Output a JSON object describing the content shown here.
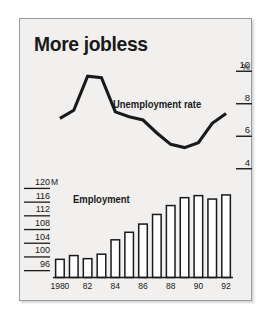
{
  "figure": {
    "title": "More jobless",
    "panel_bg": "#f1f0ee",
    "ink": "#1a1a1a",
    "border_color": "#9a9a9a"
  },
  "labels": {
    "unemployment": "Unemployment rate",
    "employment": "Employment",
    "percent_symbol": "%",
    "millions_unit": "M"
  },
  "axes": {
    "right_ticks": [
      "10",
      "8",
      "6",
      "4"
    ],
    "right_tick_values": [
      10,
      8,
      6,
      4
    ],
    "left_ticks": [
      "120",
      "116",
      "112",
      "108",
      "104",
      "100",
      "96"
    ],
    "left_tick_values": [
      120,
      116,
      112,
      108,
      104,
      100,
      96
    ],
    "x_ticks": [
      "1980",
      "82",
      "84",
      "86",
      "88",
      "90",
      "92"
    ],
    "x_tick_years": [
      1980,
      1982,
      1984,
      1986,
      1988,
      1990,
      1992
    ]
  },
  "chart_data": {
    "type": "bar",
    "title": "More jobless",
    "xlabel": "",
    "ylabel": "",
    "grid": false,
    "legend_position": "inline-annotation",
    "categories": [
      "1980",
      "1981",
      "1982",
      "1983",
      "1984",
      "1985",
      "1986",
      "1987",
      "1988",
      "1989",
      "1990",
      "1991",
      "1992"
    ],
    "x": [
      1980,
      1981,
      1982,
      1983,
      1984,
      1985,
      1986,
      1987,
      1988,
      1989,
      1990,
      1991,
      1992
    ],
    "series": [
      {
        "name": "Employment",
        "type": "bar",
        "unit": "millions",
        "axis": "left",
        "ylim": [
          94,
          121
        ],
        "ylabel": "120 M",
        "values": [
          99.3,
          100.4,
          99.5,
          100.8,
          105.0,
          107.2,
          109.6,
          112.4,
          115.0,
          117.3,
          117.9,
          116.9,
          118.1
        ]
      },
      {
        "name": "Unemployment rate",
        "type": "line",
        "unit": "percent",
        "axis": "right",
        "ylim": [
          3.0,
          11.0
        ],
        "ylabel": "%",
        "values": [
          7.1,
          7.6,
          9.7,
          9.6,
          7.5,
          7.2,
          7.0,
          6.2,
          5.5,
          5.3,
          5.6,
          6.8,
          7.4
        ]
      }
    ]
  }
}
